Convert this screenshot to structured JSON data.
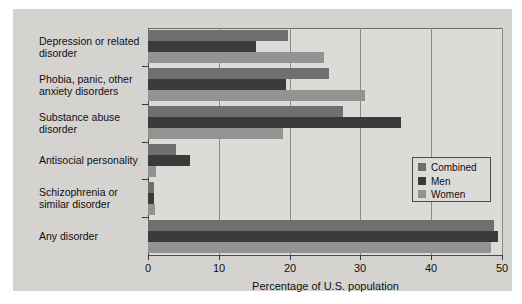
{
  "chart_data": {
    "type": "bar",
    "orientation": "horizontal",
    "title": "",
    "xlabel": "Percentage of U.S. population",
    "ylabel": "",
    "xlim": [
      0,
      50
    ],
    "xticks": [
      0,
      10,
      20,
      30,
      40,
      50
    ],
    "grid": true,
    "legend_position": "center-right",
    "categories": [
      "Depression or related disorder",
      "Phobia, panic, other anxiety disorders",
      "Substance abuse disorder",
      "Antisocial personality",
      "Schizophrenia or similar disorder",
      "Any disorder"
    ],
    "category_labels": [
      "Depression or related\ndisorder",
      "Phobia, panic, other\nanxiety disorders",
      "Substance abuse\ndisorder",
      "Antisocial personality",
      "Schizophrenia or\nsimilar disorder",
      "Any disorder"
    ],
    "series": [
      {
        "name": "Combined",
        "color": "#6f6f6f",
        "values": [
          19.8,
          25.5,
          27.6,
          4.0,
          0.9,
          48.9
        ]
      },
      {
        "name": "Men",
        "color": "#3b3b3b",
        "values": [
          15.3,
          19.5,
          35.7,
          6.0,
          0.8,
          49.5
        ]
      },
      {
        "name": "Women",
        "color": "#939391",
        "values": [
          24.9,
          30.6,
          19.1,
          1.2,
          1.0,
          48.4
        ]
      }
    ]
  },
  "legend": {
    "items": [
      {
        "label": "Combined"
      },
      {
        "label": "Men"
      },
      {
        "label": "Women"
      }
    ]
  },
  "axis": {
    "x_tick_labels": [
      "0",
      "10",
      "20",
      "30",
      "40",
      "50"
    ],
    "x_axis_title": "Percentage of U.S. population"
  },
  "colors": {
    "page_background": "#ffffff",
    "panel_background": "#d4d3d0",
    "plot_background": "#dcdbd8",
    "axis": "#4a4a4a",
    "gridline": "#8c8b88",
    "combined": "#6f6f6f",
    "men": "#3b3b3b",
    "women": "#939391"
  }
}
